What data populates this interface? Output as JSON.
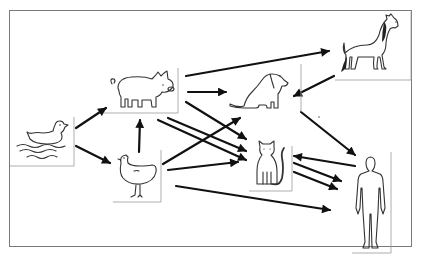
{
  "diagram": {
    "frame": {
      "x": 9,
      "y": 10,
      "width": 404,
      "height": 238,
      "border_color": "#7a7a7a"
    },
    "arrow_color": "#111111",
    "nodes": [
      {
        "id": "duck",
        "label": "duck",
        "icon": "duck-icon",
        "box": [
          14,
          117,
          74,
          162
        ]
      },
      {
        "id": "pig",
        "label": "pig",
        "icon": "pig-icon",
        "box": [
          106,
          67,
          178,
          113
        ]
      },
      {
        "id": "chicken",
        "label": "chicken",
        "icon": "chicken-icon",
        "box": [
          113,
          148,
          162,
          202
        ]
      },
      {
        "id": "dog",
        "label": "dog",
        "icon": "dog-icon",
        "box": [
          228,
          64,
          301,
          112
        ]
      },
      {
        "id": "horse",
        "label": "horse",
        "icon": "horse-icon",
        "box": [
          335,
          12,
          411,
          80
        ]
      },
      {
        "id": "cat",
        "label": "cat",
        "icon": "cat-icon",
        "box": [
          249,
          143,
          293,
          191
        ]
      },
      {
        "id": "human",
        "label": "human",
        "icon": "human-icon",
        "box": [
          351,
          152,
          391,
          253
        ]
      }
    ],
    "edges": [
      {
        "from": "duck",
        "to": "pig"
      },
      {
        "from": "duck",
        "to": "chicken"
      },
      {
        "from": "chicken",
        "to": "pig"
      },
      {
        "from": "pig",
        "to": "horse"
      },
      {
        "from": "pig",
        "to": "dog"
      },
      {
        "from": "pig",
        "to": "cat"
      },
      {
        "from": "pig",
        "to": "human"
      },
      {
        "from": "pig",
        "to": "cat"
      },
      {
        "from": "chicken",
        "to": "dog"
      },
      {
        "from": "chicken",
        "to": "cat"
      },
      {
        "from": "chicken",
        "to": "human"
      },
      {
        "from": "horse",
        "to": "dog"
      },
      {
        "from": "dog",
        "to": "human"
      },
      {
        "from": "human",
        "to": "cat"
      },
      {
        "from": "cat",
        "to": "human"
      },
      {
        "from": "cat",
        "to": "human"
      }
    ]
  }
}
